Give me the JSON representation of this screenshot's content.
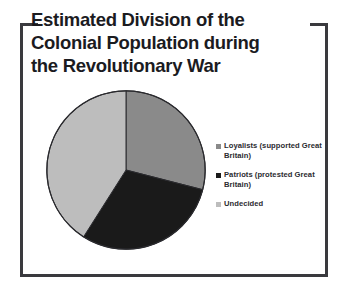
{
  "slide": {
    "title_lines": [
      "Estimated Division of the",
      "Colonial Population during",
      "the Revolutionary War"
    ],
    "frame_color": "#3a3a3e",
    "background_color": "#ffffff"
  },
  "chart_data": {
    "type": "pie",
    "title": "Estimated Division of the Colonial Population during the Revolutionary War",
    "labels": [
      "Loyalists (supported Great Britain)",
      "Patriots (protested Great Britain)",
      "Undecided"
    ],
    "values": [
      29,
      30,
      41
    ],
    "colors": [
      "#8a8a8a",
      "#1a1a1a",
      "#bdbdbd"
    ],
    "start_angle": 0,
    "direction": "clockwise",
    "legend_position": "right",
    "grid": false,
    "xlabel": "",
    "ylabel": ""
  },
  "legend": {
    "items": [
      {
        "label": "Loyalists (supported Great Britain)",
        "color": "#8a8a8a"
      },
      {
        "label": "Patriots (protested Great Britain)",
        "color": "#1a1a1a"
      },
      {
        "label": "Undecided",
        "color": "#bdbdbd"
      }
    ]
  }
}
